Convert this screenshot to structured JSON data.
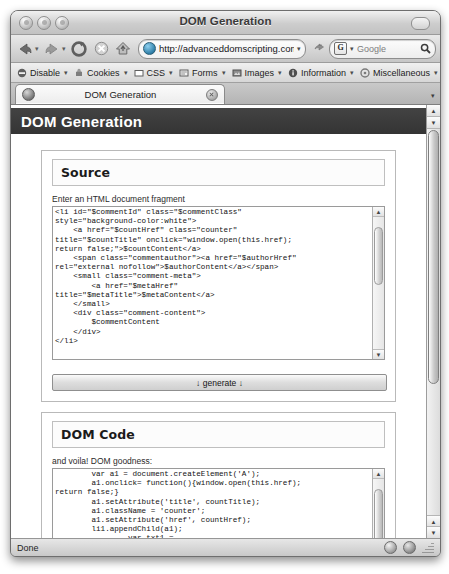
{
  "window": {
    "title": "DOM Generation",
    "traffic_lights": [
      "close-button",
      "minimize-button",
      "zoom-button"
    ]
  },
  "navbar": {
    "back_icon": "back-arrow-icon",
    "forward_icon": "forward-arrow-icon",
    "reload_icon": "reload-icon",
    "stop_icon": "stop-icon",
    "home_icon": "home-icon",
    "url": "http://advanceddomscripting.com/",
    "url_dropdown": "▾",
    "go_icon": "go-arrow-icon",
    "search_engine": "G",
    "search_placeholder": "Google",
    "search_value": "",
    "search_icon": "magnifier-icon"
  },
  "devbar": {
    "items": [
      {
        "label": "Disable",
        "icon": "disable-icon"
      },
      {
        "label": "Cookies",
        "icon": "cookies-icon"
      },
      {
        "label": "CSS",
        "icon": "css-icon"
      },
      {
        "label": "Forms",
        "icon": "forms-icon"
      },
      {
        "label": "Images",
        "icon": "images-icon"
      },
      {
        "label": "Information",
        "icon": "information-icon"
      },
      {
        "label": "Miscellaneous",
        "icon": "miscellaneous-icon"
      },
      {
        "label": "Outl",
        "icon": "outline-icon"
      }
    ],
    "dropdown_caret": "▾"
  },
  "tabbar": {
    "tab_label": "DOM Generation",
    "favicon": "site-favicon",
    "close_icon": "close-tab-icon",
    "list_caret": "▾"
  },
  "page": {
    "header_title": "DOM Generation",
    "source_panel": {
      "heading": "Source",
      "hint": "Enter an HTML document fragment",
      "code": "<li id=\"$commentId\" class=\"$commentClass\"\nstyle=\"background-color:white\">\n    <a href=\"$countHref\" class=\"counter\"\ntitle=\"$countTitle\" onclick=\"window.open(this.href);\nreturn false;\">$countContent</a>\n    <span class=\"commentauthor\"><a href=\"$authorHref\"\nrel=\"external nofollow\">$authorContent</a></span>\n    <small class=\"comment-meta\">\n        <a href=\"$metaHref\"\ntitle=\"$metaTitle\">$metaContent</a>\n    </small>\n    <div class=\"comment-content\">\n        $commentContent\n    </div>\n</li>"
    },
    "generate_button": "↓ generate ↓",
    "dom_panel": {
      "heading": "DOM Code",
      "hint": "and voila! DOM goodness:",
      "code": "        var a1 = document.createElement('A');\n        a1.onclick= function(){window.open(this.href);\nreturn false;}\n        a1.setAttribute('title', countTitle);\n        a1.className = 'counter';\n        a1.setAttribute('href', countHref);\n        li1.appendChild(a1);\n                var txt1 =\ndocument.createTextNode(countContent);\n                a1.appendChild(txt1);\n        var span1 = document.createElement('SPAN');\n        span1.className = 'commentauthor';\n        li1.appendChild(span1);\n                var a2 = document.createElement('A');"
    }
  },
  "statusbar": {
    "text": "Done",
    "indicator_1": "security-indicator-icon",
    "indicator_2": "privacy-indicator-icon",
    "resize_grip": "resize-grip-icon"
  }
}
